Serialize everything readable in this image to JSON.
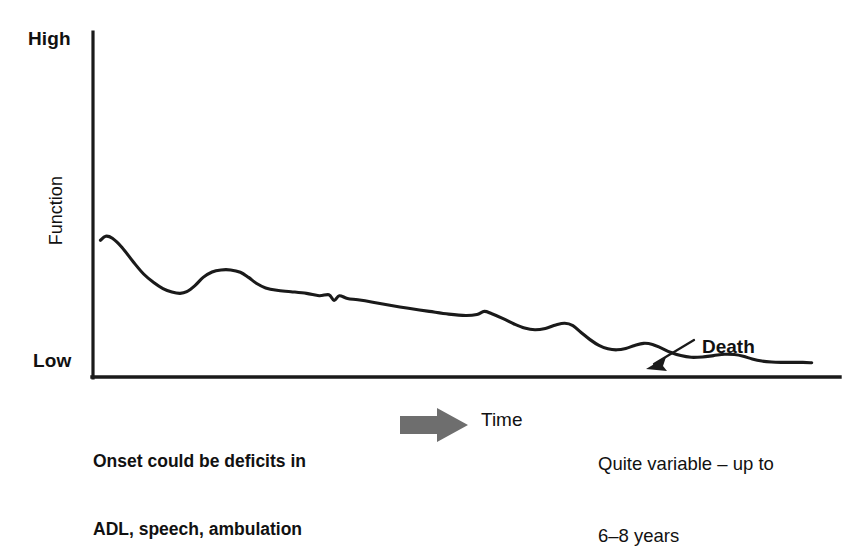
{
  "chart_data": {
    "type": "line",
    "title": "",
    "xlabel": "Time",
    "ylabel": "Function",
    "ytick_labels": [
      "High",
      "Low"
    ],
    "ylim": [
      0,
      1
    ],
    "xlim": [
      0,
      1
    ],
    "grid": false,
    "legend": false,
    "annotations": [
      {
        "name": "death-annotation",
        "text": "Death",
        "points_to": "curve-end"
      },
      {
        "name": "onset-annotation",
        "text": "Onset could be deficits in\nADL, speech, ambulation"
      },
      {
        "name": "duration-annotation",
        "text": "Quite variable – up to\n6–8 years"
      }
    ],
    "series": [
      {
        "name": "function-trajectory",
        "color": "#1a1a1a",
        "points": [
          [
            0.006,
            0.399
          ],
          [
            0.013,
            0.411
          ],
          [
            0.022,
            0.405
          ],
          [
            0.035,
            0.378
          ],
          [
            0.05,
            0.336
          ],
          [
            0.064,
            0.3
          ],
          [
            0.078,
            0.274
          ],
          [
            0.09,
            0.257
          ],
          [
            0.102,
            0.247
          ],
          [
            0.113,
            0.243
          ],
          [
            0.122,
            0.248
          ],
          [
            0.133,
            0.266
          ],
          [
            0.144,
            0.29
          ],
          [
            0.156,
            0.306
          ],
          [
            0.168,
            0.312
          ],
          [
            0.181,
            0.312
          ],
          [
            0.194,
            0.305
          ],
          [
            0.205,
            0.29
          ],
          [
            0.216,
            0.272
          ],
          [
            0.228,
            0.259
          ],
          [
            0.243,
            0.252
          ],
          [
            0.262,
            0.248
          ],
          [
            0.283,
            0.243
          ],
          [
            0.3,
            0.236
          ],
          [
            0.313,
            0.239
          ],
          [
            0.32,
            0.222
          ],
          [
            0.327,
            0.236
          ],
          [
            0.338,
            0.228
          ],
          [
            0.352,
            0.224
          ],
          [
            0.372,
            0.217
          ],
          [
            0.395,
            0.208
          ],
          [
            0.42,
            0.199
          ],
          [
            0.448,
            0.19
          ],
          [
            0.474,
            0.182
          ],
          [
            0.497,
            0.178
          ],
          [
            0.512,
            0.181
          ],
          [
            0.522,
            0.19
          ],
          [
            0.532,
            0.183
          ],
          [
            0.548,
            0.168
          ],
          [
            0.562,
            0.153
          ],
          [
            0.576,
            0.141
          ],
          [
            0.59,
            0.136
          ],
          [
            0.604,
            0.14
          ],
          [
            0.618,
            0.15
          ],
          [
            0.63,
            0.155
          ],
          [
            0.641,
            0.148
          ],
          [
            0.652,
            0.128
          ],
          [
            0.664,
            0.107
          ],
          [
            0.676,
            0.09
          ],
          [
            0.688,
            0.08
          ],
          [
            0.7,
            0.077
          ],
          [
            0.712,
            0.081
          ],
          [
            0.724,
            0.09
          ],
          [
            0.736,
            0.096
          ],
          [
            0.748,
            0.093
          ],
          [
            0.76,
            0.082
          ],
          [
            0.772,
            0.07
          ],
          [
            0.786,
            0.06
          ],
          [
            0.8,
            0.055
          ],
          [
            0.815,
            0.056
          ],
          [
            0.83,
            0.06
          ],
          [
            0.845,
            0.064
          ],
          [
            0.858,
            0.063
          ],
          [
            0.87,
            0.058
          ],
          [
            0.882,
            0.05
          ],
          [
            0.895,
            0.044
          ],
          [
            0.908,
            0.041
          ],
          [
            0.922,
            0.04
          ],
          [
            0.936,
            0.04
          ],
          [
            0.95,
            0.04
          ],
          [
            0.962,
            0.039
          ]
        ]
      }
    ]
  },
  "axes": {
    "y_top_label": "High",
    "y_bottom_label": "Low",
    "y_axis_title": "Function",
    "axis_color": "#1a1a1a"
  },
  "annotations": {
    "death_label": "Death",
    "death_arrow_name": "death-arrow"
  },
  "captions": {
    "onset_line1": "Onset could be deficits in",
    "onset_line2": "ADL, speech, ambulation",
    "time_label": "Time",
    "time_arrow_color": "#6e6e6e",
    "duration_line1": "Quite variable – up to",
    "duration_line2": "6–8 years"
  }
}
